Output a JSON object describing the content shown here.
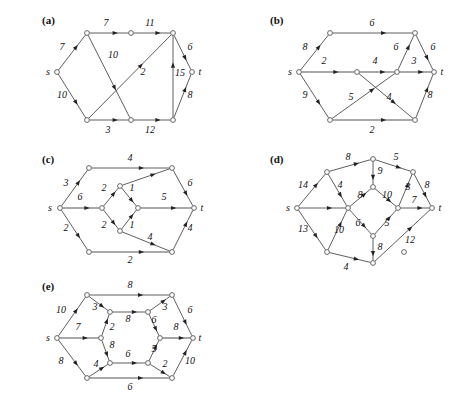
{
  "figure": {
    "width": 471,
    "height": 406,
    "background": "#ffffff",
    "edge_color": "#4d4d4d",
    "node_color": "#ffffff",
    "text_color": "#111111",
    "source_label": "s",
    "sink_label": "t"
  },
  "panels": [
    {
      "id": "a",
      "label": "(a)",
      "label_pos": [
        42,
        24
      ],
      "origin": [
        0,
        0
      ],
      "terminals": [
        {
          "name": "s",
          "text": "s",
          "x": 48,
          "y": 72
        },
        {
          "name": "t",
          "text": "t",
          "x": 200,
          "y": 72
        }
      ],
      "nodes": [
        {
          "id": "s",
          "x": 57,
          "y": 72
        },
        {
          "id": "n1",
          "x": 87,
          "y": 33
        },
        {
          "id": "n2",
          "x": 131,
          "y": 33
        },
        {
          "id": "n3",
          "x": 173,
          "y": 33
        },
        {
          "id": "n4",
          "x": 192,
          "y": 72
        },
        {
          "id": "n5",
          "x": 173,
          "y": 120
        },
        {
          "id": "n6",
          "x": 131,
          "y": 120
        },
        {
          "id": "n7",
          "x": 87,
          "y": 120
        }
      ],
      "edges": [
        {
          "from": "s",
          "to": "n1",
          "weight": "7",
          "lx": 62,
          "ly": 50,
          "thick": false
        },
        {
          "from": "n1",
          "to": "n2",
          "weight": "7",
          "lx": 106,
          "ly": 26,
          "thick": false
        },
        {
          "from": "n2",
          "to": "n3",
          "weight": "11",
          "lx": 150,
          "ly": 26,
          "thick": false
        },
        {
          "from": "n1",
          "to": "n6",
          "weight": "10",
          "lx": 113,
          "ly": 58,
          "thick": false
        },
        {
          "from": "s",
          "to": "n7",
          "weight": "10",
          "lx": 62,
          "ly": 98,
          "thick": false
        },
        {
          "from": "n7",
          "to": "n3",
          "weight": "2",
          "lx": 143,
          "ly": 75,
          "thick": false
        },
        {
          "from": "n7",
          "to": "n6",
          "weight": "3",
          "lx": 108,
          "ly": 133,
          "thick": false
        },
        {
          "from": "n6",
          "to": "n5",
          "weight": "12",
          "lx": 150,
          "ly": 133,
          "thick": false
        },
        {
          "from": "n5",
          "to": "n3",
          "weight": "15",
          "lx": 180,
          "ly": 76,
          "thick": false
        },
        {
          "from": "n3",
          "to": "n4",
          "weight": "6",
          "lx": 190,
          "ly": 50,
          "thick": false
        },
        {
          "from": "n5",
          "to": "n4",
          "weight": "8",
          "lx": 190,
          "ly": 98,
          "thick": false
        }
      ]
    },
    {
      "id": "b",
      "label": "(b)",
      "label_pos": [
        270,
        24
      ],
      "origin": [
        236,
        0
      ],
      "terminals": [
        {
          "name": "s",
          "text": "s",
          "x": 290,
          "y": 72
        },
        {
          "name": "t",
          "text": "t",
          "x": 442,
          "y": 72
        }
      ],
      "nodes": [
        {
          "id": "s",
          "x": 299,
          "y": 72
        },
        {
          "id": "n1",
          "x": 330,
          "y": 33
        },
        {
          "id": "n2",
          "x": 415,
          "y": 33
        },
        {
          "id": "n3",
          "x": 434,
          "y": 72
        },
        {
          "id": "n4",
          "x": 415,
          "y": 120
        },
        {
          "id": "n5",
          "x": 330,
          "y": 120
        },
        {
          "id": "n6",
          "x": 357,
          "y": 72
        },
        {
          "id": "n7",
          "x": 397,
          "y": 72
        }
      ],
      "edges": [
        {
          "from": "s",
          "to": "n1",
          "weight": "8",
          "lx": 305,
          "ly": 50,
          "thick": false
        },
        {
          "from": "n1",
          "to": "n2",
          "weight": "6",
          "lx": 372,
          "ly": 26,
          "thick": false
        },
        {
          "from": "s",
          "to": "n6",
          "weight": "2",
          "lx": 324,
          "ly": 64,
          "thick": true
        },
        {
          "from": "n6",
          "to": "n7",
          "weight": "4",
          "lx": 375,
          "ly": 64,
          "thick": true
        },
        {
          "from": "n7",
          "to": "n3",
          "weight": "3",
          "lx": 414,
          "ly": 64,
          "thick": true
        },
        {
          "from": "n7",
          "to": "n2",
          "weight": "6",
          "lx": 396,
          "ly": 50,
          "thick": false
        },
        {
          "from": "n2",
          "to": "n3",
          "weight": "6",
          "lx": 433,
          "ly": 50,
          "thick": false
        },
        {
          "from": "s",
          "to": "n5",
          "weight": "9",
          "lx": 305,
          "ly": 98,
          "thick": false
        },
        {
          "from": "n5",
          "to": "n7",
          "weight": "5",
          "lx": 351,
          "ly": 100,
          "thick": false
        },
        {
          "from": "n6",
          "to": "n4",
          "weight": "4",
          "lx": 389,
          "ly": 100,
          "thick": false
        },
        {
          "from": "n5",
          "to": "n4",
          "weight": "2",
          "lx": 372,
          "ly": 133,
          "thick": true
        },
        {
          "from": "n4",
          "to": "n3",
          "weight": "8",
          "lx": 430,
          "ly": 98,
          "thick": false
        }
      ]
    },
    {
      "id": "c",
      "label": "(c)",
      "label_pos": [
        42,
        163
      ],
      "origin": [
        0,
        145
      ],
      "terminals": [
        {
          "name": "s",
          "text": "s",
          "x": 50,
          "y": 208
        },
        {
          "name": "t",
          "text": "t",
          "x": 202,
          "y": 208
        }
      ],
      "nodes": [
        {
          "id": "s",
          "x": 60,
          "y": 208
        },
        {
          "id": "n1",
          "x": 89,
          "y": 168
        },
        {
          "id": "n2",
          "x": 172,
          "y": 168
        },
        {
          "id": "n3",
          "x": 194,
          "y": 208
        },
        {
          "id": "n4",
          "x": 172,
          "y": 252
        },
        {
          "id": "n5",
          "x": 89,
          "y": 252
        },
        {
          "id": "n6",
          "x": 102,
          "y": 208
        },
        {
          "id": "n7",
          "x": 120,
          "y": 186
        },
        {
          "id": "n8",
          "x": 138,
          "y": 208
        },
        {
          "id": "n9",
          "x": 120,
          "y": 231
        }
      ],
      "edges": [
        {
          "from": "s",
          "to": "n1",
          "weight": "3",
          "lx": 66,
          "ly": 186,
          "thick": false
        },
        {
          "from": "n1",
          "to": "n2",
          "weight": "4",
          "lx": 130,
          "ly": 161,
          "thick": false
        },
        {
          "from": "s",
          "to": "n6",
          "weight": "6",
          "lx": 80,
          "ly": 200,
          "thick": true
        },
        {
          "from": "n6",
          "to": "n7",
          "weight": "2",
          "lx": 104,
          "ly": 191,
          "thick": false
        },
        {
          "from": "n7",
          "to": "n8",
          "weight": "1",
          "lx": 132,
          "ly": 191,
          "thick": false
        },
        {
          "from": "n6",
          "to": "n9",
          "weight": "2",
          "lx": 104,
          "ly": 228,
          "thick": false
        },
        {
          "from": "n9",
          "to": "n8",
          "weight": "1",
          "lx": 132,
          "ly": 228,
          "thick": false
        },
        {
          "from": "n7",
          "to": "n2",
          "weight": "",
          "lx": 0,
          "ly": 0,
          "thick": false
        },
        {
          "from": "n8",
          "to": "n3",
          "weight": "5",
          "lx": 164,
          "ly": 200,
          "thick": true
        },
        {
          "from": "n2",
          "to": "n3",
          "weight": "6",
          "lx": 190,
          "ly": 186,
          "thick": false
        },
        {
          "from": "s",
          "to": "n5",
          "weight": "2",
          "lx": 66,
          "ly": 231,
          "thick": false
        },
        {
          "from": "n5",
          "to": "n4",
          "weight": "2",
          "lx": 130,
          "ly": 263,
          "thick": true
        },
        {
          "from": "n9",
          "to": "n4",
          "weight": "4",
          "lx": 150,
          "ly": 240,
          "thick": false
        },
        {
          "from": "n4",
          "to": "n3",
          "weight": "4",
          "lx": 190,
          "ly": 231,
          "thick": false
        }
      ]
    },
    {
      "id": "d",
      "label": "(d)",
      "label_pos": [
        270,
        163
      ],
      "origin": [
        236,
        145
      ],
      "terminals": [
        {
          "name": "s",
          "text": "s",
          "x": 288,
          "y": 208
        },
        {
          "name": "t",
          "text": "t",
          "x": 440,
          "y": 208
        }
      ],
      "nodes": [
        {
          "id": "s",
          "x": 297,
          "y": 208
        },
        {
          "id": "n1",
          "x": 327,
          "y": 172
        },
        {
          "id": "n2",
          "x": 373,
          "y": 159
        },
        {
          "id": "n3",
          "x": 413,
          "y": 172
        },
        {
          "id": "n4",
          "x": 432,
          "y": 208
        },
        {
          "id": "n5",
          "x": 404,
          "y": 252
        },
        {
          "id": "n6",
          "x": 373,
          "y": 263
        },
        {
          "id": "n7",
          "x": 327,
          "y": 252
        },
        {
          "id": "n8",
          "x": 348,
          "y": 208
        },
        {
          "id": "n9",
          "x": 373,
          "y": 187
        },
        {
          "id": "n10",
          "x": 398,
          "y": 208
        },
        {
          "id": "n11",
          "x": 373,
          "y": 236
        }
      ],
      "edges": [
        {
          "from": "s",
          "to": "n1",
          "weight": "14",
          "lx": 303,
          "ly": 188,
          "thick": false
        },
        {
          "from": "n1",
          "to": "n2",
          "weight": "8",
          "lx": 348,
          "ly": 160,
          "thick": false
        },
        {
          "from": "n2",
          "to": "n3",
          "weight": "5",
          "lx": 396,
          "ly": 160,
          "thick": false
        },
        {
          "from": "n1",
          "to": "n8",
          "weight": "4",
          "lx": 340,
          "ly": 188,
          "thick": false
        },
        {
          "from": "n2",
          "to": "n9",
          "weight": "9",
          "lx": 380,
          "ly": 174,
          "thick": false
        },
        {
          "from": "s",
          "to": "n8",
          "weight": "",
          "lx": 0,
          "ly": 0,
          "thick": false
        },
        {
          "from": "n8",
          "to": "n9",
          "weight": "8",
          "lx": 360,
          "ly": 198,
          "thick": false
        },
        {
          "from": "n9",
          "to": "n10",
          "weight": "10",
          "lx": 387,
          "ly": 198,
          "thick": false
        },
        {
          "from": "n8",
          "to": "n11",
          "weight": "6",
          "lx": 358,
          "ly": 226,
          "thick": false
        },
        {
          "from": "n11",
          "to": "n10",
          "weight": "5",
          "lx": 387,
          "ly": 226,
          "thick": false
        },
        {
          "from": "n10",
          "to": "n3",
          "weight": "3",
          "lx": 408,
          "ly": 190,
          "thick": false
        },
        {
          "from": "n3",
          "to": "n4",
          "weight": "8",
          "lx": 427,
          "ly": 188,
          "thick": false
        },
        {
          "from": "n10",
          "to": "n4",
          "weight": "7",
          "lx": 414,
          "ly": 203,
          "thick": false
        },
        {
          "from": "s",
          "to": "n7",
          "weight": "13",
          "lx": 303,
          "ly": 232,
          "thick": false
        },
        {
          "from": "n7",
          "to": "n8",
          "weight": "10",
          "lx": 339,
          "ly": 233,
          "thick": false
        },
        {
          "from": "n7",
          "to": "n6",
          "weight": "4",
          "lx": 346,
          "ly": 270,
          "thick": false
        },
        {
          "from": "n11",
          "to": "n6",
          "weight": "8",
          "lx": 380,
          "ly": 250,
          "thick": false
        },
        {
          "from": "n6",
          "to": "n4",
          "weight": "12",
          "lx": 410,
          "ly": 243,
          "thick": false
        }
      ]
    },
    {
      "id": "e",
      "label": "(e)",
      "label_pos": [
        42,
        290
      ],
      "origin": [
        0,
        270
      ],
      "terminals": [
        {
          "name": "s",
          "text": "s",
          "x": 48,
          "y": 338
        },
        {
          "name": "t",
          "text": "t",
          "x": 200,
          "y": 338
        }
      ],
      "nodes": [
        {
          "id": "s",
          "x": 57,
          "y": 338
        },
        {
          "id": "n1",
          "x": 87,
          "y": 295
        },
        {
          "id": "n2",
          "x": 172,
          "y": 295
        },
        {
          "id": "n3",
          "x": 193,
          "y": 338
        },
        {
          "id": "n4",
          "x": 172,
          "y": 378
        },
        {
          "id": "n5",
          "x": 87,
          "y": 378
        },
        {
          "id": "n6",
          "x": 101,
          "y": 338
        },
        {
          "id": "n7",
          "x": 110,
          "y": 312
        },
        {
          "id": "n8",
          "x": 148,
          "y": 312
        },
        {
          "id": "n9",
          "x": 160,
          "y": 338
        },
        {
          "id": "n10",
          "x": 148,
          "y": 363
        },
        {
          "id": "n11",
          "x": 110,
          "y": 363
        }
      ],
      "edges": [
        {
          "from": "s",
          "to": "n1",
          "weight": "10",
          "lx": 61,
          "ly": 313,
          "thick": false
        },
        {
          "from": "n1",
          "to": "n2",
          "weight": "8",
          "lx": 130,
          "ly": 288,
          "thick": false
        },
        {
          "from": "n1",
          "to": "n7",
          "weight": "3",
          "lx": 95,
          "ly": 310,
          "thick": false
        },
        {
          "from": "n7",
          "to": "n8",
          "weight": "8",
          "lx": 128,
          "ly": 322,
          "thick": false
        },
        {
          "from": "n8",
          "to": "n2",
          "weight": "3",
          "lx": 165,
          "ly": 310,
          "thick": false
        },
        {
          "from": "s",
          "to": "n6",
          "weight": "7",
          "lx": 78,
          "ly": 330,
          "thick": true
        },
        {
          "from": "n6",
          "to": "n7",
          "weight": "2",
          "lx": 112,
          "ly": 330,
          "thick": false
        },
        {
          "from": "n6",
          "to": "n11",
          "weight": "8",
          "lx": 112,
          "ly": 348,
          "thick": false
        },
        {
          "from": "n11",
          "to": "n10",
          "weight": "6",
          "lx": 128,
          "ly": 357,
          "thick": false
        },
        {
          "from": "n8",
          "to": "n9",
          "weight": "6",
          "lx": 154,
          "ly": 323,
          "thick": false
        },
        {
          "from": "n10",
          "to": "n9",
          "weight": "5",
          "lx": 154,
          "ly": 352,
          "thick": false
        },
        {
          "from": "n9",
          "to": "n3",
          "weight": "8",
          "lx": 176,
          "ly": 330,
          "thick": true
        },
        {
          "from": "n2",
          "to": "n3",
          "weight": "6",
          "lx": 190,
          "ly": 313,
          "thick": false
        },
        {
          "from": "s",
          "to": "n5",
          "weight": "8",
          "lx": 61,
          "ly": 364,
          "thick": false
        },
        {
          "from": "n5",
          "to": "n11",
          "weight": "4",
          "lx": 96,
          "ly": 367,
          "thick": false
        },
        {
          "from": "n5",
          "to": "n4",
          "weight": "6",
          "lx": 130,
          "ly": 390,
          "thick": true
        },
        {
          "from": "n10",
          "to": "n4",
          "weight": "2",
          "lx": 165,
          "ly": 367,
          "thick": false
        },
        {
          "from": "n4",
          "to": "n3",
          "weight": "10",
          "lx": 190,
          "ly": 364,
          "thick": false
        }
      ]
    }
  ]
}
